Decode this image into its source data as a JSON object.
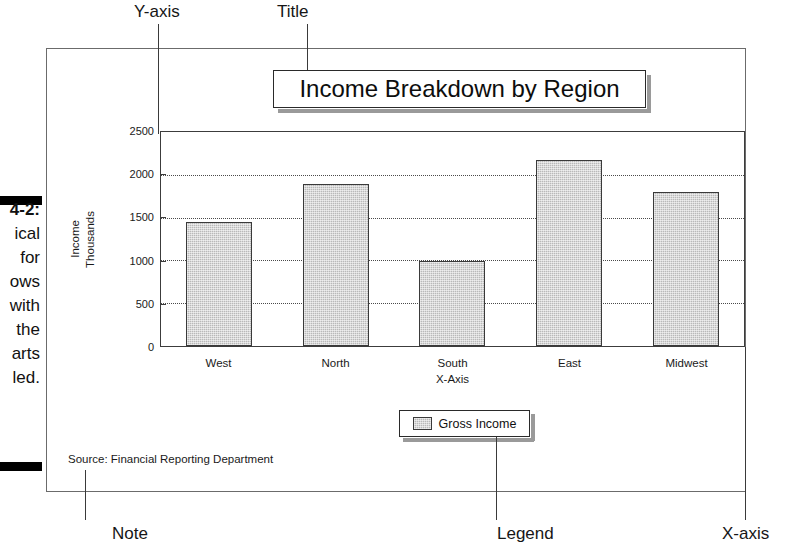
{
  "figure": {
    "caption_lines": [
      "4-2:",
      "ical",
      "for",
      "ows",
      "with",
      "the",
      "arts",
      "led."
    ]
  },
  "annotations": {
    "y_axis": "Y-axis",
    "title": "Title",
    "note": "Note",
    "legend": "Legend",
    "x_axis": "X-axis"
  },
  "source_note": "Source: Financial Reporting Department",
  "chart_data": {
    "type": "bar",
    "title": "Income Breakdown by Region",
    "categories": [
      "West",
      "North",
      "South",
      "East",
      "Midwest"
    ],
    "values": [
      1450,
      1890,
      990,
      2170,
      1800
    ],
    "series": [
      {
        "name": "Gross Income",
        "values": [
          1450,
          1890,
          990,
          2170,
          1800
        ]
      }
    ],
    "xlabel": "X-Axis",
    "ylabel_lines": [
      "Income",
      "Thousands"
    ],
    "ylim": [
      0,
      2500
    ],
    "yticks": [
      0,
      500,
      1000,
      1500,
      2000,
      2500
    ],
    "ytick_labels": [
      "0",
      "500",
      "1000",
      "1500",
      "2000",
      "2500"
    ],
    "grid": true,
    "legend_position": "bottom",
    "legend_entries": [
      "Gross Income"
    ],
    "bar_color": "#b9b9b9",
    "bar_edge_color": "#3a3a3a"
  }
}
